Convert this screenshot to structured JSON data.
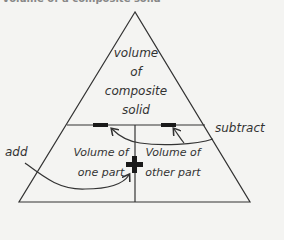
{
  "title": "Volume of a composite solid",
  "diagram": {
    "top_section": [
      "volume",
      "of",
      "composite",
      "solid"
    ],
    "bottom_left": [
      "Volume of",
      "one part"
    ],
    "bottom_right": [
      "Volume of",
      "other part"
    ],
    "operator_plus": "+",
    "operator_minus": "−",
    "annotations": {
      "add": "add",
      "subtract": "subtract"
    }
  },
  "colors": {
    "line": "#333333",
    "background": "#f4f4f2",
    "operator": "#1a1a1a"
  }
}
